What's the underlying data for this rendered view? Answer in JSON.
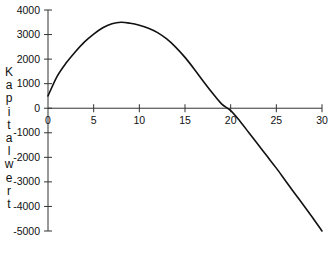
{
  "chart_data": {
    "type": "line",
    "title": "",
    "xlabel": "",
    "ylabel": "Kapitalwert",
    "xlim": [
      0,
      30
    ],
    "ylim": [
      -5000,
      4000
    ],
    "grid": false,
    "legend": null,
    "x_ticks": [
      0,
      5,
      10,
      15,
      20,
      25,
      30
    ],
    "x_tick_labels": [
      "0",
      "5",
      "10",
      "15",
      "20",
      "25",
      "30"
    ],
    "y_ticks": [
      4000,
      3000,
      2000,
      1000,
      0,
      -1000,
      -2000,
      -3000,
      -4000,
      -5000
    ],
    "y_tick_labels": [
      "4000",
      "3000",
      "2000",
      "1000",
      "0",
      "-1000",
      "-2000",
      "-3000",
      "-4000",
      "-5000"
    ],
    "series": [
      {
        "name": "Kapitalwert",
        "color": "#111111",
        "x": [
          0,
          1,
          2,
          3,
          4,
          5,
          6,
          7,
          8,
          9,
          10,
          11,
          12,
          13,
          14,
          15,
          16,
          17,
          18,
          19,
          20,
          21,
          22,
          23,
          24,
          25,
          26,
          27,
          28,
          29,
          30
        ],
        "values": [
          500,
          1300,
          1850,
          2300,
          2700,
          3020,
          3280,
          3440,
          3500,
          3460,
          3380,
          3260,
          3080,
          2820,
          2480,
          2070,
          1600,
          1100,
          620,
          180,
          -100,
          -520,
          -1000,
          -1480,
          -1960,
          -2440,
          -2950,
          -3460,
          -3960,
          -4470,
          -5000
        ]
      }
    ]
  }
}
